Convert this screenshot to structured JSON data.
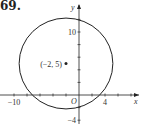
{
  "problem_number": "69.",
  "chart_data": {
    "type": "scatter",
    "title": "",
    "xlabel": "x",
    "ylabel": "y",
    "origin_label": "O",
    "xlim": [
      -12,
      8.5
    ],
    "ylim": [
      -4.5,
      15
    ],
    "x_ticks": [
      -10,
      -8,
      -6,
      -4,
      -2,
      2,
      4,
      6,
      8
    ],
    "y_ticks": [
      -4,
      -2,
      2,
      4,
      6,
      8,
      10,
      12
    ],
    "x_tick_labels": [
      {
        "value": -10,
        "label": "−10"
      },
      {
        "value": 4,
        "label": "4"
      }
    ],
    "y_tick_labels": [
      {
        "value": 10,
        "label": "10"
      },
      {
        "value": -4,
        "label": "−4"
      }
    ],
    "circle": {
      "center": [
        -2,
        5
      ],
      "radius": 7.21
    },
    "points": [
      {
        "x": -2,
        "y": 5,
        "label": "(−2, 5)"
      }
    ],
    "grid": false,
    "colors": {
      "ink": "#222222"
    }
  }
}
